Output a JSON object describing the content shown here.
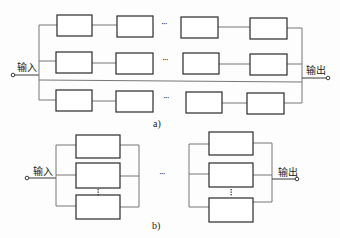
{
  "diagram": {
    "part_a": {
      "caption": "a)",
      "input_label": "输入",
      "output_label": "输出",
      "ellipsis": "···",
      "rows": 3,
      "blocks_per_row_shown": 4
    },
    "part_b": {
      "caption": "b)",
      "input_label": "输入",
      "output_label": "输出",
      "ellipsis": "···",
      "vertical_ellipsis": "⋮",
      "groups_shown": 2,
      "blocks_per_group_shown": 3
    },
    "colors": {
      "line": "#3a3a3a",
      "box_stroke": "#2a2a2a",
      "bus": "#8a8a8a"
    }
  }
}
